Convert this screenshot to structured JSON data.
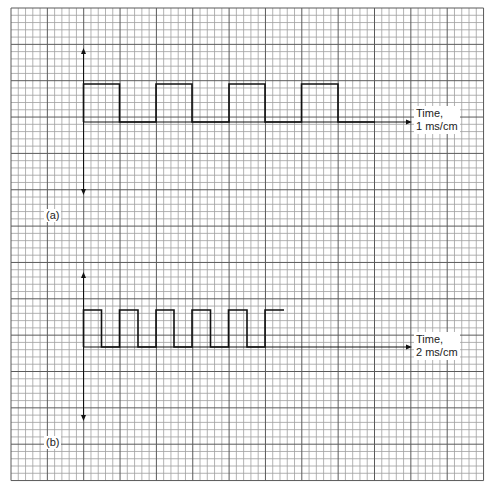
{
  "figure": {
    "grid": {
      "left": 11,
      "top": 8,
      "cells_x": 65,
      "cells_y": 65,
      "cell_px": 7.27,
      "major_every": 5,
      "minor_color": "#a0a0a0",
      "major_color": "#5a5a5a"
    },
    "panels": [
      {
        "id": "a",
        "label": "(a)",
        "time_label_line1": "Time,",
        "time_label_line2": "1 ms/cm",
        "axis_x": 83.5,
        "axis_top": 48,
        "axis_bottom": 195,
        "baseline_y": 122,
        "high_y": 84,
        "time_axis_end_x": 412,
        "wave_transitions_x": [
          83.5,
          119.5,
          156,
          192,
          229,
          265,
          301.5,
          338
        ],
        "wave_end_x": 375
      },
      {
        "id": "b",
        "label": "(b)",
        "time_label_line1": "Time,",
        "time_label_line2": "2 ms/cm",
        "axis_x": 83.5,
        "axis_top": 272,
        "axis_bottom": 421,
        "baseline_y": 347,
        "high_y": 310,
        "time_axis_end_x": 412,
        "wave_transitions_x": [
          83.5,
          101.5,
          119.5,
          138,
          156,
          174,
          192,
          210.5,
          228.5,
          247,
          265
        ],
        "wave_end_x": 284
      }
    ]
  },
  "chart_data": [
    {
      "type": "line",
      "title": "(a)",
      "xlabel": "Time, 1 ms/cm",
      "ylabel": "",
      "description": "Square wave, period 2 cm (2 ms), 50% duty cycle, amplitude 1 cm",
      "x_cm": [
        0,
        0,
        1,
        1,
        2,
        2,
        3,
        3,
        4,
        4,
        5,
        5,
        6,
        6,
        7,
        7,
        8
      ],
      "y_cm": [
        0,
        1,
        1,
        0,
        0,
        1,
        1,
        0,
        0,
        1,
        1,
        0,
        0,
        1,
        1,
        0,
        0
      ],
      "period_ms": 2,
      "cycles_shown": 4
    },
    {
      "type": "line",
      "title": "(b)",
      "xlabel": "Time, 2 ms/cm",
      "ylabel": "",
      "description": "Square wave, period 1 cm (2 ms), 50% duty cycle, amplitude 1 cm",
      "x_cm": [
        0,
        0,
        0.5,
        0.5,
        1,
        1,
        1.5,
        1.5,
        2,
        2,
        2.5,
        2.5,
        3,
        3,
        3.5,
        3.5,
        4,
        4,
        4.5,
        4.5,
        5,
        5,
        5.5
      ],
      "y_cm": [
        0,
        1,
        1,
        0,
        0,
        1,
        1,
        0,
        0,
        1,
        1,
        0,
        0,
        1,
        1,
        0,
        0,
        1,
        1,
        0,
        0,
        1,
        1
      ],
      "period_ms": 2,
      "cycles_shown": 5.5
    }
  ]
}
